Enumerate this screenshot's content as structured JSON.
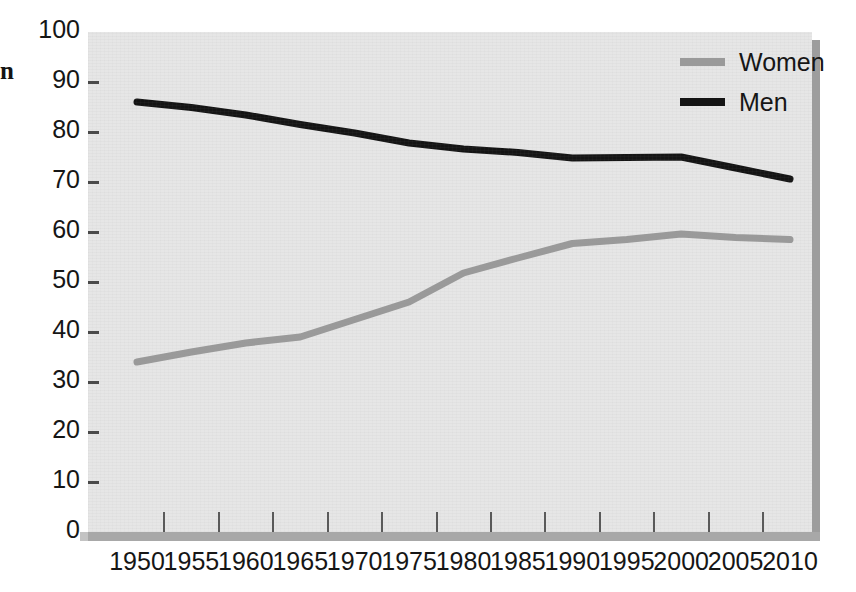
{
  "chart_data": {
    "type": "line",
    "title": "",
    "xlabel": "",
    "ylabel": "",
    "ylim": [
      0,
      100
    ],
    "xlim": [
      1950,
      2010
    ],
    "grid": false,
    "legend_position": "top-right",
    "x": [
      1950,
      1955,
      1960,
      1965,
      1970,
      1975,
      1980,
      1985,
      1990,
      1995,
      2000,
      2005,
      2010
    ],
    "xtick_labels": [
      "1950",
      "1955",
      "1960",
      "1965",
      "1970",
      "1975",
      "1980",
      "1985",
      "1990",
      "1995",
      "2000",
      "2005",
      "2010"
    ],
    "ytick_labels": [
      "0",
      "10",
      "20",
      "30",
      "40",
      "50",
      "60",
      "70",
      "80",
      "90",
      "100"
    ],
    "yticks": [
      0,
      10,
      20,
      30,
      40,
      50,
      60,
      70,
      80,
      90,
      100
    ],
    "series": [
      {
        "name": "Women",
        "color": "#9a9a9a",
        "values": [
          34.0,
          36.0,
          37.8,
          39.0,
          42.5,
          46.0,
          51.8,
          54.8,
          57.7,
          58.5,
          59.6,
          58.9,
          58.5
        ]
      },
      {
        "name": "Men",
        "color": "#141414",
        "values": [
          86.0,
          84.9,
          83.4,
          81.5,
          79.8,
          77.8,
          76.6,
          75.9,
          74.8,
          74.9,
          75.0,
          72.8,
          70.6
        ]
      }
    ]
  },
  "legend": {
    "items": [
      {
        "label": "Women",
        "color": "#9a9a9a"
      },
      {
        "label": "Men",
        "color": "#141414"
      }
    ]
  },
  "axes": {
    "y_labels": [
      "100",
      "90",
      "80",
      "70",
      "60",
      "50",
      "40",
      "30",
      "20",
      "10",
      "0"
    ],
    "x_labels": [
      "1950",
      "1955",
      "1960",
      "1965",
      "1970",
      "1975",
      "1980",
      "1985",
      "1990",
      "1995",
      "2000",
      "2005",
      "2010"
    ]
  },
  "edge_glyph": "n"
}
